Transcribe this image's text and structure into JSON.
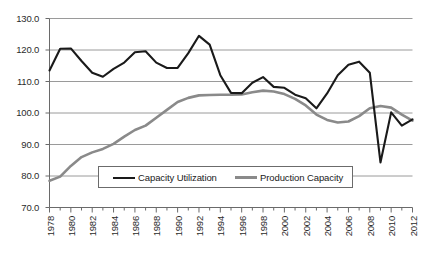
{
  "chart_data": {
    "type": "line",
    "title": "",
    "xlabel": "",
    "ylabel": "",
    "ylim": [
      70.0,
      130.0
    ],
    "y_ticks": [
      "130.0",
      "120.0",
      "110.0",
      "100.0",
      "90.0",
      "80.0",
      "70.0"
    ],
    "y_tick_values": [
      130.0,
      120.0,
      110.0,
      100.0,
      90.0,
      80.0,
      70.0
    ],
    "grid": true,
    "legend_position": "inside-bottom-center",
    "x": [
      1978,
      1979,
      1980,
      1981,
      1982,
      1983,
      1984,
      1985,
      1986,
      1987,
      1988,
      1989,
      1990,
      1991,
      1992,
      1993,
      1994,
      1995,
      1996,
      1997,
      1998,
      1999,
      2000,
      2001,
      2002,
      2003,
      2004,
      2005,
      2006,
      2007,
      2008,
      2009,
      2010,
      2011,
      2012
    ],
    "x_tick_labels": [
      "1978",
      "1980",
      "1982",
      "1984",
      "1986",
      "1988",
      "1990",
      "1992",
      "1994",
      "1996",
      "1998",
      "2000",
      "2002",
      "2004",
      "2006",
      "2008",
      "2010",
      "2012"
    ],
    "x_tick_label_values": [
      1978,
      1980,
      1982,
      1984,
      1986,
      1988,
      1990,
      1992,
      1994,
      1996,
      1998,
      2000,
      2002,
      2004,
      2006,
      2008,
      2010,
      2012
    ],
    "series": [
      {
        "name": "Capacity Utilization",
        "color": "#1a1a1a",
        "width": 2.1,
        "values": [
          113.5,
          120.4,
          120.5,
          116.5,
          112.8,
          111.5,
          114.0,
          116.0,
          119.3,
          119.6,
          116.0,
          114.3,
          114.3,
          119.0,
          124.5,
          121.7,
          112.0,
          106.4,
          106.3,
          109.6,
          111.4,
          108.3,
          108.0,
          105.8,
          104.7,
          101.5,
          106.2,
          112.0,
          115.3,
          116.3,
          112.8,
          84.3,
          100.2,
          96.0,
          98.0
        ]
      },
      {
        "name": "Production  Capacity",
        "color": "#8a8a8a",
        "width": 2.6,
        "values": [
          78.5,
          79.8,
          83.2,
          86.0,
          87.5,
          88.6,
          90.2,
          92.5,
          94.6,
          96.0,
          98.5,
          101.0,
          103.5,
          104.8,
          105.6,
          105.7,
          105.8,
          105.8,
          105.9,
          106.6,
          107.1,
          106.8,
          106.0,
          104.5,
          102.4,
          99.5,
          97.8,
          97.0,
          97.3,
          99.0,
          101.5,
          102.2,
          101.7,
          99.5,
          97.6
        ]
      }
    ]
  },
  "legend": {
    "entries": [
      {
        "label": "Capacity Utilization",
        "color": "#1a1a1a"
      },
      {
        "label": "Production  Capacity",
        "color": "#8a8a8a"
      }
    ]
  }
}
